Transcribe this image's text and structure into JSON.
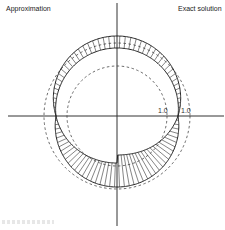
{
  "labels": {
    "left": "Approximation",
    "right": "Exact solution"
  },
  "ticks": {
    "inner": "1.0",
    "outer": "1.0"
  },
  "colors": {
    "stroke": "#222222",
    "hatch": "#333333",
    "dashed": "#444444",
    "background": "#ffffff"
  },
  "geometry": {
    "center": [
      117,
      116
    ],
    "outer_dashed_radius": 73,
    "inner_dashed_radius": 50,
    "hatch_count": 90
  }
}
